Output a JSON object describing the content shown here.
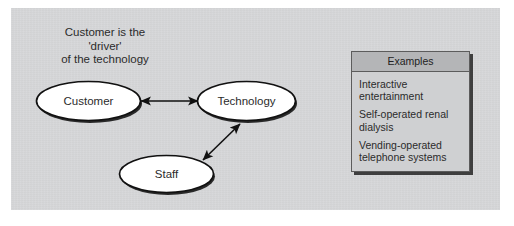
{
  "figure": {
    "caption": "Customer is the\n'driver'\nof the technology",
    "panel_color": "#d6d7d9",
    "background_color": "#ffffff"
  },
  "diagram": {
    "type": "relationship-diagram",
    "nodes": [
      {
        "id": "customer",
        "label": "Customer"
      },
      {
        "id": "technology",
        "label": "Technology"
      },
      {
        "id": "staff",
        "label": "Staff"
      }
    ],
    "connectors": [
      {
        "from": "customer",
        "to": "technology",
        "style": "double-headed-arrow",
        "orientation": "horizontal"
      },
      {
        "from": "staff",
        "to": "technology",
        "style": "double-headed-arrow",
        "orientation": "diagonal"
      }
    ],
    "node_fill": "#ffffff",
    "node_stroke": "#111111"
  },
  "examples": {
    "title": "Examples",
    "items": [
      "Interactive entertainment",
      "Self-operated renal dialysis",
      "Vending-operated telephone systems"
    ],
    "header_color": "#b4b5b7",
    "body_color": "#cfd0d2",
    "border_color": "#5c5c5c"
  }
}
